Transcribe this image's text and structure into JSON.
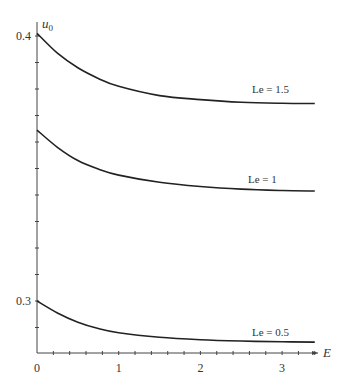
{
  "chart_data": {
    "type": "line",
    "title": "",
    "xlabel": "E",
    "ylabel": "u0",
    "xlim": [
      0,
      3.4
    ],
    "ylim": [
      0.28,
      0.405
    ],
    "x_ticks": [
      0,
      1,
      2,
      3
    ],
    "x_tick_labels": [
      "0",
      "1",
      "2",
      "3"
    ],
    "x_minor_step": 0.2,
    "y_tick_labels_shown": [
      "0.3",
      "0.4"
    ],
    "y_tick_positions_shown": [
      0.3,
      0.4
    ],
    "y_minor_step": 0.01,
    "grid": false,
    "legend": "inline labels near right end of each curve",
    "x": [
      0,
      0.25,
      0.5,
      0.75,
      1.0,
      1.5,
      2.0,
      2.5,
      3.0,
      3.4
    ],
    "series": [
      {
        "name": "Le = 1.5",
        "values": [
          0.401,
          0.3935,
          0.388,
          0.384,
          0.381,
          0.3775,
          0.376,
          0.375,
          0.3746,
          0.3745
        ]
      },
      {
        "name": "Le = 1",
        "values": [
          0.3645,
          0.358,
          0.353,
          0.3498,
          0.3475,
          0.3448,
          0.3432,
          0.3422,
          0.3417,
          0.3415
        ]
      },
      {
        "name": "Le = 0.5",
        "values": [
          0.3,
          0.2955,
          0.292,
          0.2896,
          0.288,
          0.2863,
          0.2854,
          0.2849,
          0.2846,
          0.2845
        ]
      }
    ]
  },
  "labels": {
    "y_axis_title": "u",
    "y_axis_sub": "0",
    "x_axis_title": "E",
    "y_tick_03": "0.3",
    "y_tick_04": "0.4",
    "x_tick_0": "0",
    "x_tick_1": "1",
    "x_tick_2": "2",
    "x_tick_3": "3",
    "series_le15": "Le = 1.5",
    "series_le1": "Le = 1",
    "series_le05": "Le = 0.5"
  }
}
